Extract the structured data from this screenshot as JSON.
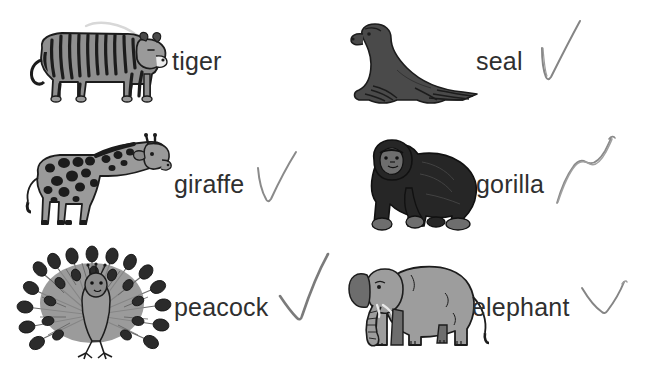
{
  "page": {
    "background_color": "#ffffff",
    "text_color": "#2f2f2f",
    "check_color": "#7b7b7b",
    "columns": 2,
    "rows": 3
  },
  "items": [
    {
      "label": "tiger",
      "icon": "tiger-illustration",
      "checked": false,
      "check_style": "none",
      "body_color": "#8f8f8f",
      "detail_color": "#1c1c1c"
    },
    {
      "label": "seal",
      "icon": "seal-illustration",
      "checked": true,
      "check_style": "narrow-v",
      "body_color": "#4a4a4a",
      "detail_color": "#1c1c1c"
    },
    {
      "label": "giraffe",
      "icon": "giraffe-illustration",
      "checked": true,
      "check_style": "narrow-v",
      "body_color": "#9a9a9a",
      "detail_color": "#1c1c1c"
    },
    {
      "label": "gorilla",
      "icon": "gorilla-illustration",
      "checked": true,
      "check_style": "wobbly-double",
      "body_color": "#262626",
      "detail_color": "#6e6e6e"
    },
    {
      "label": "peacock",
      "icon": "peacock-illustration",
      "checked": true,
      "check_style": "bold-check",
      "body_color": "#8a8a8a",
      "detail_color": "#1c1c1c"
    },
    {
      "label": "elephant",
      "icon": "elephant-illustration",
      "checked": true,
      "check_style": "shallow-check",
      "body_color": "#9d9d9d",
      "detail_color": "#5a5a5a"
    }
  ]
}
